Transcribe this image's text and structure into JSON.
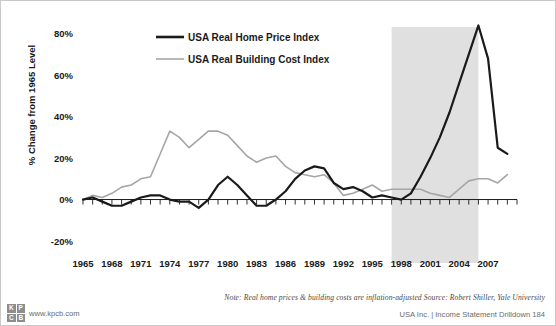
{
  "chart_data": {
    "type": "line",
    "title": "",
    "xlabel": "",
    "ylabel": "% Change from 1965 Level",
    "ylim": [
      -20,
      90
    ],
    "yticks": [
      -20,
      0,
      20,
      40,
      60,
      80
    ],
    "ytick_labels": [
      "-20%",
      "0%",
      "20%",
      "40%",
      "60%",
      "80%"
    ],
    "xlim": [
      1965,
      2010
    ],
    "xticks": [
      1965,
      1968,
      1971,
      1974,
      1977,
      1980,
      1983,
      1986,
      1989,
      1992,
      1995,
      1998,
      2001,
      2004,
      2007
    ],
    "xtick_labels": [
      "1965",
      "1968",
      "1971",
      "1974",
      "1977",
      "1980",
      "1983",
      "1986",
      "1989",
      "1992",
      "1995",
      "1998",
      "2001",
      "2004",
      "2007"
    ],
    "minor_tick_interval": 1,
    "grid": false,
    "legend_position": "top-center",
    "shaded_band": {
      "label": "",
      "x_start": 1997,
      "x_end": 2006,
      "color": "#e0e0e0"
    },
    "x": [
      1965,
      1966,
      1967,
      1968,
      1969,
      1970,
      1971,
      1972,
      1973,
      1974,
      1975,
      1976,
      1977,
      1978,
      1979,
      1980,
      1981,
      1982,
      1983,
      1984,
      1985,
      1986,
      1987,
      1988,
      1989,
      1990,
      1991,
      1992,
      1993,
      1994,
      1995,
      1996,
      1997,
      1998,
      1999,
      2000,
      2001,
      2002,
      2003,
      2004,
      2005,
      2006,
      2007,
      2008,
      2009
    ],
    "series": [
      {
        "name": "USA Real Home Price Index",
        "color": "#1a1a1a",
        "width": 2.2,
        "values": [
          0,
          1,
          -1,
          -3,
          -3,
          -1,
          1,
          2,
          2,
          0,
          -1,
          -1,
          -4,
          0,
          7,
          11,
          7,
          2,
          -3,
          -3,
          0,
          4,
          10,
          14,
          16,
          15,
          8,
          5,
          6,
          4,
          1,
          2,
          1,
          0,
          3,
          11,
          20,
          30,
          42,
          56,
          70,
          84,
          68,
          25,
          22
        ]
      },
      {
        "name": "USA Real Building Cost Index",
        "color": "#a6a6a6",
        "width": 1.6,
        "values": [
          0,
          2,
          1,
          3,
          6,
          7,
          10,
          11,
          22,
          33,
          30,
          25,
          29,
          33,
          33,
          31,
          26,
          21,
          18,
          20,
          21,
          16,
          13,
          12,
          11,
          12,
          8,
          2,
          3,
          5,
          7,
          4,
          5,
          5,
          5,
          5,
          3,
          2,
          1,
          5,
          9,
          10,
          10,
          8,
          12
        ]
      }
    ]
  },
  "legend": {
    "entries": [
      {
        "label": "USA Real Home Price Index",
        "color": "#1a1a1a",
        "width": 2.6
      },
      {
        "label": "USA Real Building Cost Index",
        "color": "#a6a6a6",
        "width": 1.6
      }
    ]
  },
  "footer": {
    "note": "Note: Real home prices & building costs are inflation-adjusted  Source: Robert Shiller, Yale University",
    "deck": "USA Inc. | Income Statement Drilldown    184"
  },
  "brand": {
    "logo_letters": [
      "K",
      "P",
      "C",
      "B"
    ],
    "url": "www.kpcb.com"
  }
}
